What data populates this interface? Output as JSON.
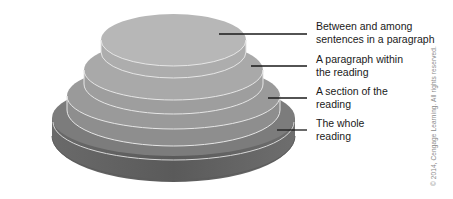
{
  "diagram": {
    "type": "stacked-tier-cake",
    "tiers": [
      {
        "level": 1,
        "lines": [
          "Between and among",
          "sentences in a paragraph"
        ],
        "color": "#b6b6b6"
      },
      {
        "level": 2,
        "lines": [
          "A paragraph within",
          "the reading"
        ],
        "color": "#a6a6a6"
      },
      {
        "level": 3,
        "lines": [
          "A section of the",
          "reading"
        ],
        "color": "#969696"
      },
      {
        "level": 4,
        "lines": [
          "The whole",
          "reading"
        ],
        "color": "#7a7a7a"
      }
    ],
    "edge_color": "#e6e6e6",
    "leader_color": "#1a1a1a"
  },
  "copyright": "© 2014, Cengage Learning. All rights reserved."
}
